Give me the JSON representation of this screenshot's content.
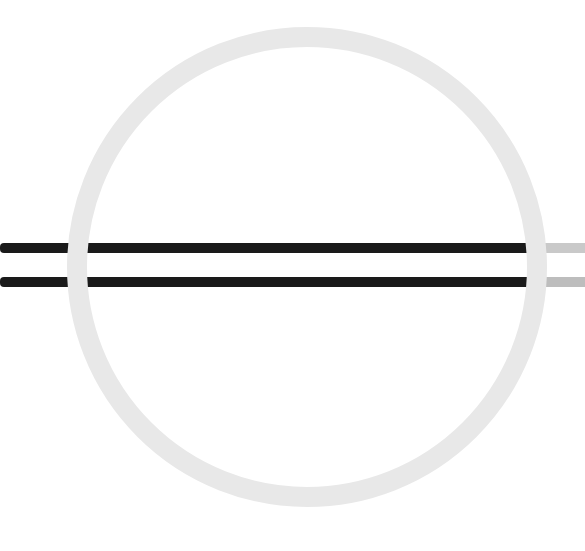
{
  "diagram": {
    "ring": {
      "cx": 307,
      "cy": 267,
      "r": 230,
      "stroke_width": 20,
      "color": "#e8e8e8"
    },
    "bars": [
      {
        "y": 248,
        "height": 10,
        "left_color": "#1a1a1a",
        "right_color": "#c9c9c9"
      },
      {
        "y": 282,
        "height": 10,
        "left_color": "#1a1a1a",
        "right_color": "#bdbdbd"
      }
    ],
    "colors": {
      "background": "#ffffff",
      "ring": "#e8e8e8",
      "bar_dark": "#1a1a1a",
      "bar_light": "#c4c4c4"
    }
  }
}
